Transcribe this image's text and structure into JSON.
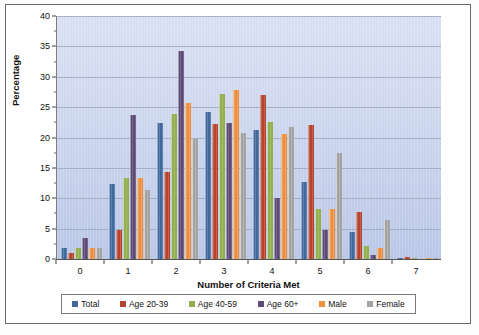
{
  "chart_data": {
    "type": "bar",
    "title": "",
    "xlabel": "Number of Criteria Met",
    "ylabel": "Percentage",
    "categories": [
      "0",
      "1",
      "2",
      "3",
      "4",
      "5",
      "6",
      "7"
    ],
    "ylim": [
      0,
      40
    ],
    "ytick_labels": [
      "0",
      "5",
      "10",
      "15",
      "20",
      "25",
      "30",
      "35",
      "40"
    ],
    "ytick_values": [
      0,
      5,
      10,
      15,
      20,
      25,
      30,
      35,
      40
    ],
    "grid": true,
    "legend_position": "bottom",
    "series": [
      {
        "name": "Total",
        "color": "#41699e",
        "values": [
          1.8,
          12.4,
          22.4,
          24.2,
          21.2,
          12.7,
          4.4,
          0.2
        ]
      },
      {
        "name": "Age 20-39",
        "color": "#b5432d",
        "values": [
          1.0,
          4.8,
          14.3,
          22.2,
          27.0,
          22.0,
          7.7,
          0.3
        ]
      },
      {
        "name": "Age 40-59",
        "color": "#93ae4e",
        "values": [
          1.8,
          13.4,
          23.9,
          27.1,
          22.5,
          8.2,
          2.1,
          0.2
        ]
      },
      {
        "name": "Age 60+",
        "color": "#5c4a77",
        "values": [
          3.4,
          23.7,
          34.2,
          22.4,
          10.0,
          4.7,
          0.6,
          0.0
        ]
      },
      {
        "name": "Male",
        "color": "#ef8f3c",
        "values": [
          1.8,
          13.4,
          25.6,
          27.8,
          20.5,
          8.2,
          1.8,
          0.1
        ]
      },
      {
        "name": "Female",
        "color": "#a3a3a3",
        "values": [
          1.8,
          11.3,
          19.7,
          20.7,
          21.8,
          17.5,
          6.5,
          0.2
        ]
      }
    ]
  },
  "legend": {
    "items": [
      {
        "label": "Total"
      },
      {
        "label": "Age 20-39"
      },
      {
        "label": "Age 40-59"
      },
      {
        "label": "Age 60+"
      },
      {
        "label": "Male"
      },
      {
        "label": "Female"
      }
    ]
  }
}
